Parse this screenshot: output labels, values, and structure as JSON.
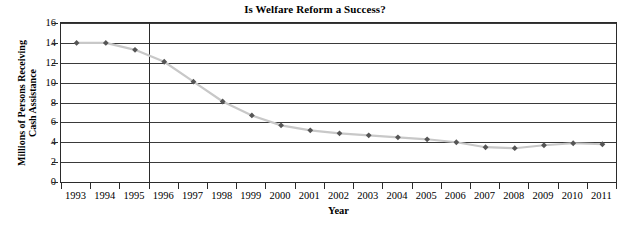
{
  "chart_data": {
    "type": "line",
    "title": "Is Welfare Reform a Success?",
    "xlabel": "Year",
    "ylabel": "Millions of Persons Receiving Cash Assistance",
    "ylabel_lines": [
      "Millions of Persons Receiving",
      "Cash Assistance"
    ],
    "categories": [
      "1993",
      "1994",
      "1995",
      "1996",
      "1997",
      "1998",
      "1999",
      "2000",
      "2001",
      "2002",
      "2003",
      "2004",
      "2005",
      "2006",
      "2007",
      "2008",
      "2009",
      "2010",
      "2011"
    ],
    "values": [
      14.1,
      14.1,
      13.4,
      12.2,
      10.2,
      8.2,
      6.8,
      5.8,
      5.3,
      5.0,
      4.8,
      4.6,
      4.4,
      4.1,
      3.6,
      3.5,
      3.8,
      4.0,
      3.9
    ],
    "series": [
      {
        "name": "Millions of Persons Receiving Cash Assistance",
        "values": [
          14.1,
          14.1,
          13.4,
          12.2,
          10.2,
          8.2,
          6.8,
          5.8,
          5.3,
          5.0,
          4.8,
          4.6,
          4.4,
          4.1,
          3.6,
          3.5,
          3.8,
          4.0,
          3.9
        ]
      }
    ],
    "ylim": [
      0,
      16
    ],
    "yticks": [
      0,
      2,
      4,
      6,
      8,
      10,
      12,
      14,
      16
    ],
    "ytick_labels": [
      "0",
      "2",
      "4",
      "6",
      "8",
      "10",
      "12",
      "14",
      "16"
    ],
    "grid": true,
    "grid_axis": "y",
    "legend": false,
    "legend_position": "none",
    "marker": "diamond",
    "marker_color": "#555555",
    "line_color": "#c8c8c8",
    "axis_color": "#2b2b2b",
    "gridline_color": "#3a3a3a",
    "background_color": "#ffffff",
    "annotations": [
      {
        "name": "welfare-reform-marker",
        "type": "vertical-line",
        "at_category": "1996",
        "at_category_index": 3,
        "position": "left-edge-of-category",
        "color": "#2b2b2b"
      }
    ]
  }
}
